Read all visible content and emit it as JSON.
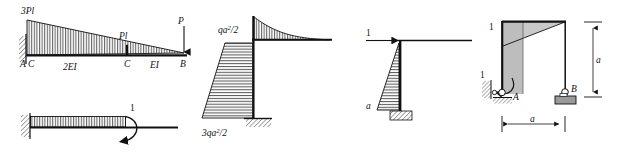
{
  "figure_set": {
    "title": "Structural mechanics bending-moment diagrams",
    "count": 5,
    "colors": {
      "ink": "#111111",
      "hatch": "#222222",
      "shade_light": "#c8c8c8",
      "shade_mid": "#a9a9a9",
      "background": "#ffffff"
    }
  },
  "fig1": {
    "name": "cantilever-beam-moment-diagram",
    "labels": {
      "peak": "3Pl",
      "mid": "Pl",
      "load": "P",
      "support_a": "A",
      "node_c_left": "C",
      "node_c_right": "C",
      "node_b": "B",
      "stiffness_left": "2EI",
      "stiffness_right": "EI"
    },
    "diagram": {
      "type": "linear-taper",
      "left_value": "3Pl",
      "mid_value": "Pl",
      "right_value": "0",
      "hatch": "vertical"
    }
  },
  "fig2": {
    "name": "unit-moment-cantilever-diagram",
    "labels": {
      "unit_moment": "1"
    },
    "diagram": {
      "type": "constant",
      "value": "1",
      "hatch": "vertical",
      "load": "unit-couple"
    }
  },
  "fig3": {
    "name": "l-frame-distributed-load-moment-diagram",
    "labels": {
      "beam_moment": "qa²/2",
      "base_moment": "3qa²/2"
    },
    "diagram": {
      "type": "curved-plus-trapezoid",
      "beam_value": "qa²/2",
      "column_top_value": "qa²/2",
      "column_base_value": "3qa²/2",
      "beam_hatch": "vertical",
      "column_hatch": "horizontal"
    }
  },
  "fig4": {
    "name": "unit-force-column-moment-diagram",
    "labels": {
      "unit_force": "1",
      "height": "a"
    },
    "diagram": {
      "type": "triangular",
      "top_value": "0",
      "base_value": "a",
      "hatch": "horizontal"
    }
  },
  "fig5": {
    "name": "portal-frame-unit-load-moment-diagram",
    "labels": {
      "unit_load_top": "1",
      "unit_moment_support": "1",
      "support_a": "A",
      "support_b": "B",
      "dim_vertical": "a",
      "dim_horizontal": "a"
    },
    "diagram": {
      "type": "shaded-frame",
      "beam": "triangular-taper",
      "column": "uniform-band",
      "shade": "#c8c8c8"
    }
  }
}
